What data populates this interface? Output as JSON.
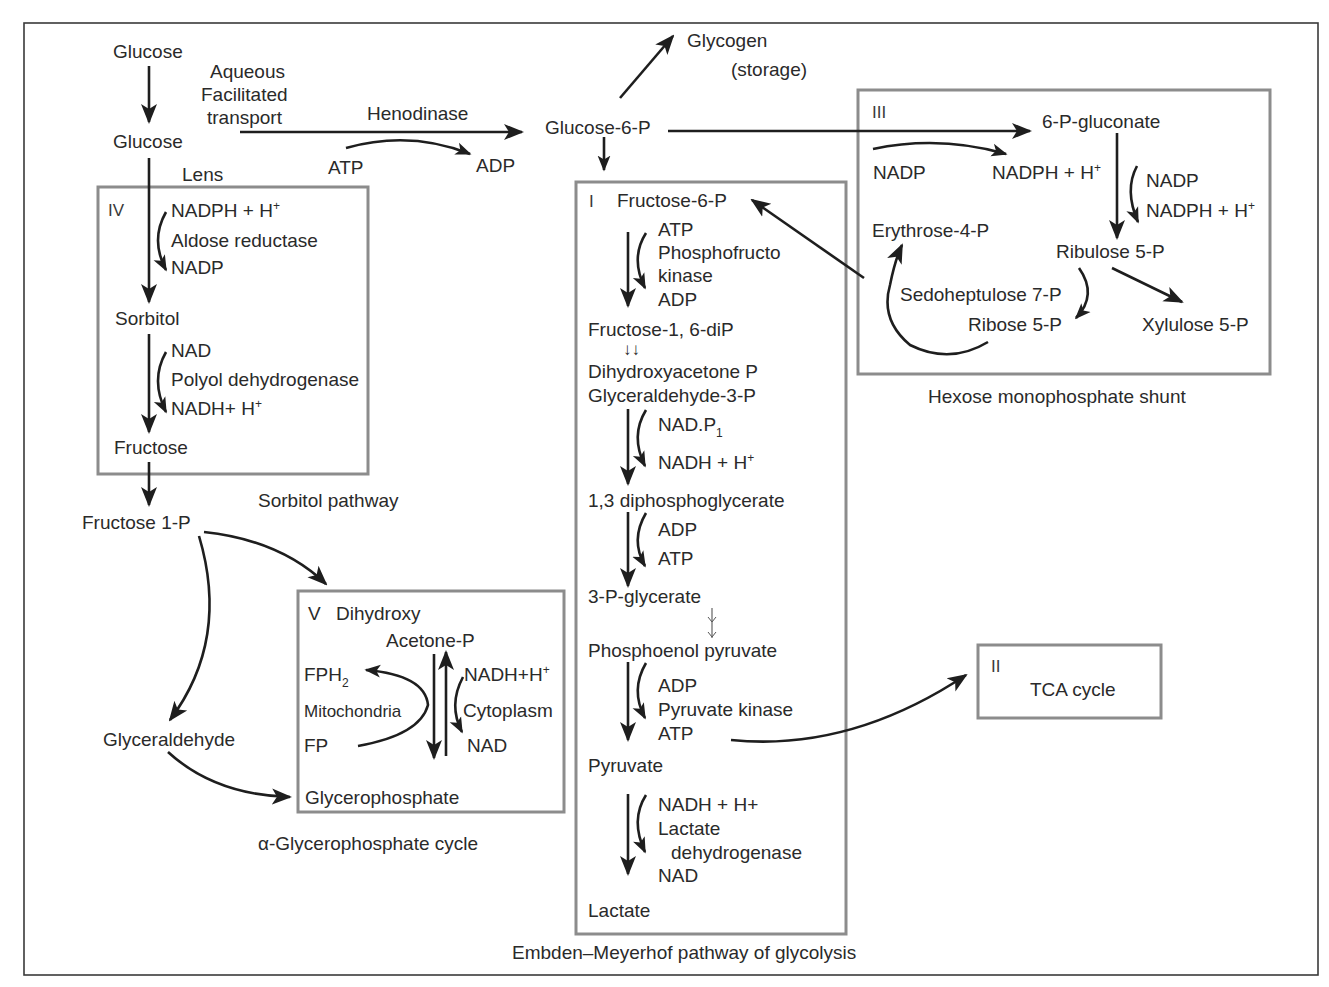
{
  "colors": {
    "frame": "#3a3a3a",
    "box": "#8c8c8c",
    "arrow": "#1e1e1e",
    "text": "#2a2a2a",
    "background": "#ffffff"
  },
  "top": {
    "glucose_aqueous": "Glucose",
    "transport": [
      "Aqueous",
      "Facilitated",
      "transport"
    ],
    "glucose_lens": "Glucose",
    "lens": "Lens",
    "enzyme_hexokinase": "Henodinase",
    "atp": "ATP",
    "adp": "ADP",
    "glucose6p": "Glucose-6-P",
    "glycogen": "Glycogen",
    "storage": "(storage)"
  },
  "sorbitol": {
    "roman": "IV",
    "nadph": "NADPH + H",
    "nadph_sup": "+",
    "aldose_reductase": "Aldose reductase",
    "nadp": "NADP",
    "sorbitol": "Sorbitol",
    "nad": "NAD",
    "polyol_dh": "Polyol dehydrogenase",
    "nadh": "NADH+ H",
    "nadh_sup": "+",
    "fructose": "Fructose",
    "caption": "Sorbitol pathway"
  },
  "fructose_branch": {
    "fructose1p": "Fructose 1-P",
    "glyceraldehyde": "Glyceraldehyde"
  },
  "glycerophosphate": {
    "roman": "V",
    "dihydroxy": "Dihydroxy",
    "acetone_p": "Acetone-P",
    "fph": "FPH",
    "fph_sub": "2",
    "mitochondria": "Mitochondria",
    "fp": "FP",
    "nadh": "NADH+H",
    "nadh_sup": "+",
    "cytoplasm": "Cytoplasm",
    "nad": "NAD",
    "glycerophosphate": "Glycerophosphate",
    "caption": "α-Glycerophosphate cycle"
  },
  "glycolysis": {
    "roman": "I",
    "fructose6p": "Fructose-6-P",
    "atp1": "ATP",
    "pfk1": "Phosphofructo",
    "pfk2": "kinase",
    "adp1": "ADP",
    "fructose16dip": "Fructose-1, 6-diP",
    "double_arrow": "↓↓",
    "dhap": "Dihydroxyacetone P",
    "g3p": "Glyceraldehyde-3-P",
    "nadp1": "NAD.P",
    "nadp1_sub": "1",
    "nadh1": "NADH + H",
    "nadh1_sup": "+",
    "bpg": "1,3 diphosphoglycerate",
    "adp2": "ADP",
    "atp2": "ATP",
    "pg3": "3-P-glycerate",
    "pep": "Phosphoenol pyruvate",
    "adp3": "ADP",
    "pyruvate_kinase": "Pyruvate kinase",
    "atp3": "ATP",
    "pyruvate": "Pyruvate",
    "nadh2": "NADH + H+",
    "ldh1": "Lactate",
    "ldh2": "dehydrogenase",
    "nad": "NAD",
    "lactate": "Lactate",
    "caption": "Embden–Meyerhof pathway of glycolysis"
  },
  "hmp": {
    "roman": "III",
    "gluconate": "6-P-gluconate",
    "nadp1": "NADP",
    "nadph1": "NADPH + H",
    "nadph1_sup": "+",
    "nadp2": "NADP",
    "nadph2": "NADPH + H",
    "nadph2_sup": "+",
    "erythrose": "Erythrose-4-P",
    "ribulose": "Ribulose 5-P",
    "sedoheptulose": "Sedoheptulose 7-P",
    "ribose": "Ribose 5-P",
    "xylulose": "Xylulose 5-P",
    "caption": "Hexose monophosphate shunt"
  },
  "tca": {
    "roman": "II",
    "label": "TCA cycle"
  }
}
